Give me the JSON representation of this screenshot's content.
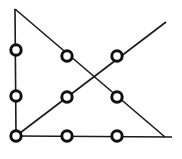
{
  "figure": {
    "canvas": {
      "width": 182,
      "height": 159
    },
    "background_color": "#ffffff",
    "line_color": "#1a1a1a",
    "node_fill_color": "#ffffff",
    "node_stroke_color": "#111111",
    "line_width": 1.6,
    "node_radius": 5.2,
    "node_stroke_width": 3.0,
    "vertices": [
      {
        "name": "top-left-apex",
        "x": 15,
        "y": 9,
        "marked": false
      },
      {
        "name": "bottom-left-corner",
        "x": 16,
        "y": 136,
        "marked": true
      },
      {
        "name": "bottom-right-corner",
        "x": 165,
        "y": 137,
        "marked": false
      },
      {
        "name": "upper-right-endpoint",
        "x": 166,
        "y": 22,
        "marked": false
      }
    ],
    "edges": [
      {
        "name": "left-vertical-edge",
        "x1": 15,
        "y1": 9,
        "x2": 16,
        "y2": 136
      },
      {
        "name": "bottom-horizontal-edge",
        "x1": 16,
        "y1": 136,
        "x2": 172,
        "y2": 137
      },
      {
        "name": "descending-diagonal-edge",
        "x1": 15,
        "y1": 9,
        "x2": 165,
        "y2": 137
      },
      {
        "name": "ascending-diagonal-edge",
        "x1": 16,
        "y1": 136,
        "x2": 166,
        "y2": 22
      }
    ],
    "nodes": [
      {
        "name": "node-left-upper",
        "x": 16,
        "y": 50,
        "on": "left-vertical-edge"
      },
      {
        "name": "node-left-middle",
        "x": 16,
        "y": 96,
        "on": "left-vertical-edge"
      },
      {
        "name": "node-left-bottom-corner",
        "x": 16,
        "y": 136,
        "on": "bottom-left-corner"
      },
      {
        "name": "node-top-middle",
        "x": 67,
        "y": 56,
        "on": "descending-diagonal-edge"
      },
      {
        "name": "node-top-right",
        "x": 117,
        "y": 56,
        "on": "ascending-diagonal-edge"
      },
      {
        "name": "node-middle-center",
        "x": 67,
        "y": 97,
        "on": "ascending-diagonal-edge"
      },
      {
        "name": "node-middle-right",
        "x": 117,
        "y": 97,
        "on": "descending-diagonal-edge"
      },
      {
        "name": "node-bottom-middle",
        "x": 67,
        "y": 136,
        "on": "bottom-horizontal-edge"
      },
      {
        "name": "node-bottom-right",
        "x": 117,
        "y": 136,
        "on": "bottom-horizontal-edge"
      }
    ],
    "crossing_point": {
      "name": "diagonal-intersection",
      "x": 95,
      "y": 76,
      "marked": false
    },
    "node_count": 9
  }
}
